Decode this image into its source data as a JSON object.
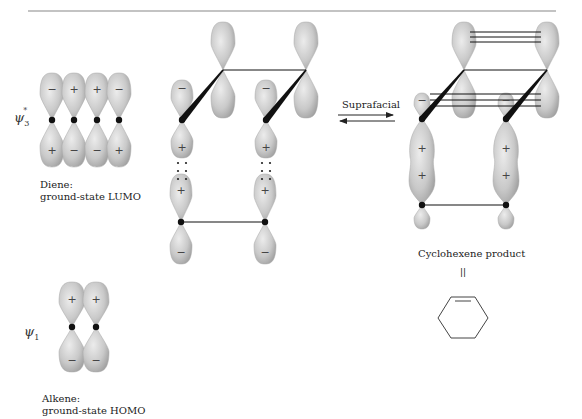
{
  "figure": {
    "reaction_arrow_label": "Suprafacial",
    "equivalence_symbol": "||"
  },
  "orbitals": {
    "diene": {
      "symbol": "ψ",
      "subscript": "3",
      "superscript": "*",
      "caption_line1": "Diene:",
      "caption_line2": "ground-state LUMO",
      "lobe_signs_top": [
        "−",
        "+",
        "+",
        "−"
      ],
      "lobe_signs_bottom": [
        "+",
        "−",
        "−",
        "+"
      ]
    },
    "alkene": {
      "symbol": "ψ",
      "subscript": "1",
      "caption_line1": "Alkene:",
      "caption_line2": "ground-state HOMO",
      "lobe_signs_top": [
        "+",
        "+"
      ],
      "lobe_signs_bottom": [
        "−",
        "−"
      ]
    }
  },
  "transition_state": {
    "front_lobe_signs_top": [
      "−",
      "−"
    ],
    "front_lobe_signs_bottom": [
      "+",
      "+"
    ],
    "alkene_lobe_signs_top": [
      "+",
      "+"
    ],
    "alkene_lobe_signs_bottom": [
      "−",
      "−"
    ]
  },
  "product": {
    "caption": "Cyclohexene product",
    "front_lobe_signs_top": [
      "−",
      "−"
    ],
    "sigma_signs": [
      "+",
      "+"
    ],
    "sigma_signs_lower": [
      "+",
      "+"
    ]
  },
  "colors": {
    "lobe_fill": "#c8c8c8",
    "lobe_edge": "#9a9a9a",
    "bond": "#111111",
    "rule": "#888888"
  }
}
